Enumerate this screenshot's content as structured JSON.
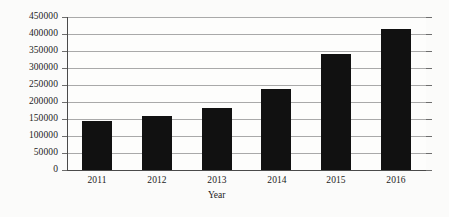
{
  "chart_data": {
    "type": "bar",
    "title": "",
    "subtitle": "",
    "xlabel": "Year",
    "ylabel": "",
    "categories": [
      "2011",
      "2012",
      "2013",
      "2014",
      "2015",
      "2016"
    ],
    "values": [
      145000,
      160000,
      182000,
      237000,
      340000,
      415000
    ],
    "series": [
      {
        "name": "",
        "values": [
          145000,
          160000,
          182000,
          237000,
          340000,
          415000
        ]
      }
    ],
    "ylim": [
      0,
      450000
    ],
    "ytick_values": [
      0,
      50000,
      100000,
      150000,
      200000,
      250000,
      300000,
      350000,
      400000,
      450000
    ],
    "ytick_labels": [
      "0",
      "50000",
      "100000",
      "150000",
      "200000",
      "250000",
      "300000",
      "350000",
      "400000",
      "450000"
    ],
    "xtick_labels": [
      "2011",
      "2012",
      "2013",
      "2014",
      "2015",
      "2016"
    ],
    "grid": true,
    "grid_axis": "y",
    "legend": false,
    "legend_position": "none",
    "bar_color": "#111111",
    "grid_color": "#9a9a9a",
    "axis_color": "#4a4a4a",
    "background_color": "#fbfbfa",
    "annotations": []
  }
}
